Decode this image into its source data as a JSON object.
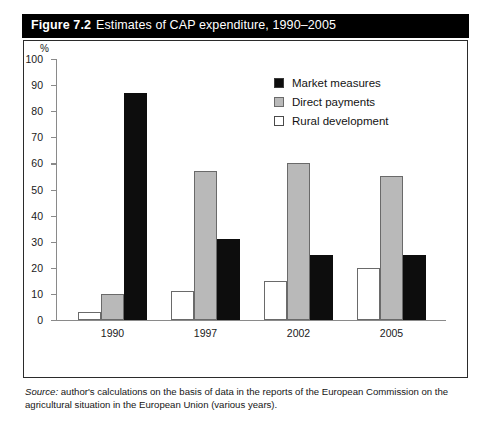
{
  "figure": {
    "number": "Figure 7.2",
    "caption": "Estimates of CAP expenditure, 1990–2005",
    "source_word": "Source:",
    "source_text": " author's calculations on the basis of data in the reports of the European Commission on the agricultural situation in the European Union (various years)."
  },
  "colors": {
    "market_measures": "#0d0d0d",
    "direct_payments": "#b9b9b9",
    "rural_development": "#ffffff",
    "axis": "#8a8a8a",
    "title_bar": "#000000",
    "title_text": "#ffffff",
    "frame": "#2b2b2b"
  },
  "chart_data": {
    "type": "bar",
    "title": "Estimates of CAP expenditure, 1990–2005",
    "xlabel": "",
    "ylabel": "%",
    "ylim": [
      0,
      100
    ],
    "yticks": [
      0,
      10,
      20,
      30,
      40,
      50,
      60,
      70,
      80,
      90,
      100
    ],
    "grid": false,
    "legend_position": "top-right",
    "categories": [
      "1990",
      "1997",
      "2002",
      "2005"
    ],
    "series": [
      {
        "name": "Market measures",
        "values": [
          87,
          31,
          25,
          25
        ]
      },
      {
        "name": "Direct payments",
        "values": [
          10,
          57,
          60,
          55
        ]
      },
      {
        "name": "Rural development",
        "values": [
          3,
          11,
          15,
          20
        ]
      }
    ],
    "bar_draw_order": [
      "Rural development",
      "Direct payments",
      "Market measures"
    ]
  }
}
